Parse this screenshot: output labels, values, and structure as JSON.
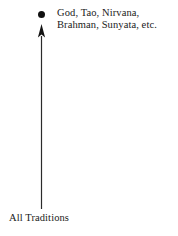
{
  "diagram": {
    "type": "upward-arrow-diagram",
    "background_color": "#ffffff",
    "ink_color": "#1a1a1a",
    "apex": {
      "marker": "filled-dot",
      "marker_color": "#111111",
      "label_lines": [
        "God, Tao, Nirvana,",
        "Brahman, Sunyata, etc."
      ]
    },
    "base": {
      "label": "All Traditions"
    },
    "arrow": {
      "direction": "up",
      "head": "solid-triangle",
      "shaft_color": "#2b2b2b"
    }
  }
}
